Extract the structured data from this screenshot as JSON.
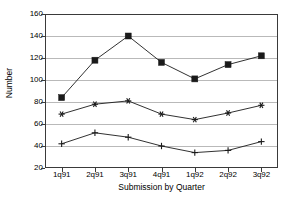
{
  "chart_data": {
    "type": "line",
    "title": "",
    "xlabel": "Submission by Quarter",
    "ylabel": "Number",
    "categories": [
      "1q91",
      "2q91",
      "3q91",
      "4q91",
      "1q92",
      "2q92",
      "3q92"
    ],
    "ylim": [
      20,
      160
    ],
    "yticks": [
      20,
      40,
      60,
      80,
      100,
      120,
      140,
      160
    ],
    "grid": true,
    "legend": "none",
    "series": [
      {
        "name": "series-1",
        "marker": "filled-square",
        "color": "#1a1a1a",
        "values": [
          84,
          118,
          140,
          116,
          101,
          114,
          122
        ]
      },
      {
        "name": "series-2",
        "marker": "asterisk",
        "color": "#1a1a1a",
        "values": [
          69,
          78,
          81,
          69,
          64,
          70,
          77
        ]
      },
      {
        "name": "series-3",
        "marker": "plus",
        "color": "#1a1a1a",
        "values": [
          42,
          52,
          48,
          40,
          34,
          36,
          44
        ]
      }
    ]
  },
  "axis": {
    "y_tick_labels": [
      "20",
      "40",
      "60",
      "80",
      "100",
      "120",
      "140",
      "160"
    ],
    "x_tick_labels": [
      "1q91",
      "2q91",
      "3q91",
      "4q91",
      "1q92",
      "2q92",
      "3q92"
    ],
    "y_title": "Number",
    "x_title": "Submission by Quarter"
  }
}
